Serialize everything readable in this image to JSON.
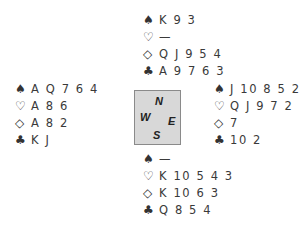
{
  "deal": {
    "north": {
      "spades": {
        "symbol": "♠",
        "cards": "K 9 3"
      },
      "hearts": {
        "symbol": "♡",
        "cards": "—"
      },
      "diamonds": {
        "symbol": "◇",
        "cards": "Q J 9 5 4"
      },
      "clubs": {
        "symbol": "♣",
        "cards": "A 9 7 6 3"
      }
    },
    "west": {
      "spades": {
        "symbol": "♠",
        "cards": "A Q 7 6 4"
      },
      "hearts": {
        "symbol": "♡",
        "cards": "A 8 6"
      },
      "diamonds": {
        "symbol": "◇",
        "cards": "A 8 2"
      },
      "clubs": {
        "symbol": "♣",
        "cards": "K J"
      }
    },
    "east": {
      "spades": {
        "symbol": "♠",
        "cards": "J 10 8 5 2"
      },
      "hearts": {
        "symbol": "♡",
        "cards": "Q J 9 7 2"
      },
      "diamonds": {
        "symbol": "◇",
        "cards": "7"
      },
      "clubs": {
        "symbol": "♣",
        "cards": "10 2"
      }
    },
    "south": {
      "spades": {
        "symbol": "♠",
        "cards": "—"
      },
      "hearts": {
        "symbol": "♡",
        "cards": "K 10 5 4 3"
      },
      "diamonds": {
        "symbol": "◇",
        "cards": "K 10 6 3"
      },
      "clubs": {
        "symbol": "♣",
        "cards": "Q 8 5 4"
      }
    }
  },
  "compass": {
    "n": "N",
    "e": "E",
    "s": "S",
    "w": "W"
  },
  "colors": {
    "text": "#3a3a3a",
    "compass_bg": "#d8d8d8",
    "compass_border": "#8a8a8a"
  }
}
